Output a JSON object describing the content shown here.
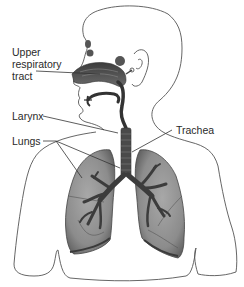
{
  "diagram": {
    "type": "anatomy-respiratory-system",
    "labels": {
      "upper_respiratory_tract": {
        "line1": "Upper",
        "line2": "respiratory",
        "line3": "tract"
      },
      "larynx": "Larynx",
      "lungs": "Lungs",
      "trachea": "Trachea"
    },
    "colors": {
      "outline": "#555555",
      "lung_fill": "#8a8a8a",
      "lung_dark": "#5a5a5a",
      "airway_dark": "#3a3a3a",
      "leader_line": "#333333",
      "background": "#ffffff"
    }
  }
}
